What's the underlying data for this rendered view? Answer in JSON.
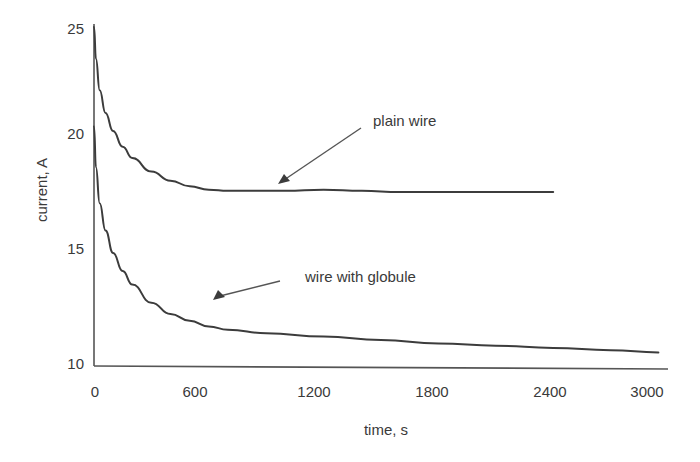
{
  "chart_data": {
    "type": "line",
    "title": "",
    "xlabel": "time, s",
    "ylabel": "current, A",
    "xlim": [
      0,
      3000
    ],
    "ylim": [
      10,
      25
    ],
    "xticks": [
      0,
      600,
      1200,
      1800,
      2400,
      3000
    ],
    "yticks": [
      10,
      15,
      20,
      25
    ],
    "xtick_labels": [
      "0",
      "600",
      "1200",
      "1800",
      "2400",
      "3000"
    ],
    "ytick_labels": [
      "10",
      "15",
      "20",
      "25"
    ],
    "grid": false,
    "legend": "none (inline annotations)",
    "series": [
      {
        "name": "plain wire",
        "x": [
          0,
          10,
          30,
          60,
          100,
          150,
          200,
          300,
          400,
          500,
          600,
          700,
          800,
          1000,
          1200,
          1400,
          1600,
          1800,
          2000,
          2200,
          2400
        ],
        "y": [
          25.0,
          23.6,
          22.2,
          21.2,
          20.4,
          19.7,
          19.2,
          18.6,
          18.2,
          17.95,
          17.8,
          17.75,
          17.75,
          17.75,
          17.8,
          17.75,
          17.7,
          17.7,
          17.7,
          17.7,
          17.7
        ]
      },
      {
        "name": "wire with globule",
        "x": [
          0,
          10,
          30,
          60,
          100,
          150,
          200,
          300,
          400,
          500,
          600,
          700,
          900,
          1200,
          1500,
          1800,
          2100,
          2400,
          2700,
          2950
        ],
        "y": [
          20.6,
          18.8,
          17.2,
          16.0,
          15.0,
          14.2,
          13.6,
          12.8,
          12.3,
          12.0,
          11.75,
          11.6,
          11.45,
          11.3,
          11.15,
          11.0,
          10.9,
          10.8,
          10.7,
          10.6
        ]
      }
    ],
    "annotations": [
      {
        "text": "plain wire",
        "arrow_to": [
          1000,
          17.75
        ]
      },
      {
        "text": "wire with globule",
        "arrow_to": [
          630,
          11.7
        ]
      }
    ]
  }
}
